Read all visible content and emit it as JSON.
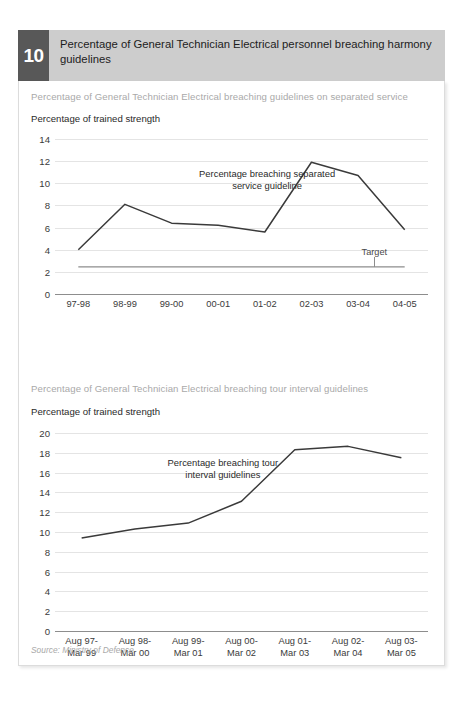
{
  "header": {
    "number": "10",
    "title": "Percentage of General Technician Electrical personnel breaching harmony guidelines"
  },
  "charts": [
    {
      "subtitle": "Percentage of General Technician Electrical breaching guidelines on separated service",
      "axis_title": "Percentage of trained strength",
      "annotation_line1": "Percentage breaching separated",
      "annotation_line2": "service guideline",
      "target_label": "Target"
    },
    {
      "subtitle": "Percentage of General Technician Electrical breaching tour interval guidelines",
      "axis_title": "Percentage of trained strength",
      "annotation_line1": "Percentage breaching tour",
      "annotation_line2": "interval guidelines"
    }
  ],
  "source": "Source: Ministry of Defence",
  "chart_data": [
    {
      "type": "line",
      "title": "Percentage of General Technician Electrical breaching guidelines on separated service",
      "xlabel": "",
      "ylabel": "Percentage of trained strength",
      "categories": [
        "97-98",
        "98-99",
        "99-00",
        "00-01",
        "01-02",
        "02-03",
        "03-04",
        "04-05"
      ],
      "series": [
        {
          "name": "Percentage breaching separated service guideline",
          "values": [
            4.0,
            8.1,
            6.4,
            6.2,
            5.6,
            11.9,
            10.7,
            5.8
          ]
        },
        {
          "name": "Target",
          "values": [
            2.45,
            2.45,
            2.45,
            2.45,
            2.45,
            2.45,
            2.45,
            2.45
          ]
        }
      ],
      "yticks": [
        0,
        2,
        4,
        6,
        8,
        10,
        12,
        14
      ],
      "ylim": [
        0,
        14
      ],
      "grid": true,
      "legend": "annotation"
    },
    {
      "type": "line",
      "title": "Percentage of General Technician Electrical breaching tour interval guidelines",
      "xlabel": "",
      "ylabel": "Percentage of trained strength",
      "categories": [
        "Aug 97-|Mar 99",
        "Aug 98-|Mar 00",
        "Aug 99-|Mar 01",
        "Aug 00-|Mar 02",
        "Aug 01-|Mar 03",
        "Aug 02-|Mar 04",
        "Aug 03-|Mar 05"
      ],
      "series": [
        {
          "name": "Percentage breaching tour interval guidelines",
          "values": [
            9.4,
            10.3,
            10.9,
            13.1,
            18.3,
            18.65,
            17.5
          ]
        }
      ],
      "yticks": [
        0,
        2,
        4,
        6,
        8,
        10,
        12,
        14,
        16,
        18,
        20
      ],
      "ylim": [
        0,
        20
      ],
      "grid": true,
      "legend": "annotation"
    }
  ],
  "colors": {
    "header_band": "#cdcdcd",
    "badge": "#585858",
    "series_line": "#3a3a3a",
    "target_line": "#8d8d8d",
    "gridline": "#e4e4e4",
    "subtitle_text": "#a9a9a9"
  }
}
